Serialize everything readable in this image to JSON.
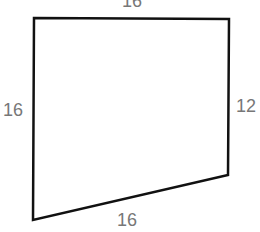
{
  "diagram": {
    "shape": "quadrilateral",
    "vertices": [
      [
        34,
        18
      ],
      [
        229,
        19
      ],
      [
        228,
        175
      ],
      [
        33,
        220
      ]
    ],
    "stroke_color": "#111111",
    "label_color": "#777777",
    "labels": {
      "top": "16",
      "left": "16",
      "right": "12",
      "bottom": "16"
    }
  }
}
